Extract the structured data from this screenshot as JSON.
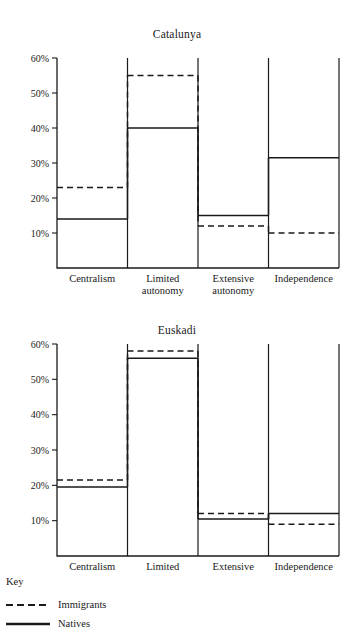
{
  "legend": {
    "title": "Key",
    "entries": [
      {
        "label": "Immigrants",
        "style": "dashed",
        "color": "#1a1a1a"
      },
      {
        "label": "Natives",
        "style": "solid",
        "color": "#1a1a1a"
      }
    ]
  },
  "axis": {
    "tick_labels": [
      "10%",
      "20%",
      "30%",
      "40%",
      "50%",
      "60%"
    ],
    "tick_values": [
      10,
      20,
      30,
      40,
      50,
      60
    ]
  },
  "categories": [
    "Centralism",
    "Limited autonomy",
    "Extensive autonomy",
    "Independence"
  ],
  "category_lines": [
    [
      "Centralism"
    ],
    [
      "Limited",
      "autonomy"
    ],
    [
      "Extensive",
      "autonomy"
    ],
    [
      "Independence"
    ]
  ],
  "chart_data": [
    {
      "type": "bar",
      "title": "Catalunya",
      "xlabel": "",
      "ylabel": "",
      "ylim": [
        0,
        60
      ],
      "grid": false,
      "legend_position": "bottom-left",
      "categories": [
        "Centralism",
        "Limited autonomy",
        "Extensive autonomy",
        "Independence"
      ],
      "series": [
        {
          "name": "Immigrants",
          "style": "dashed",
          "values": [
            23,
            55,
            12,
            10
          ]
        },
        {
          "name": "Natives",
          "style": "solid",
          "values": [
            14,
            40,
            15,
            31.5
          ]
        }
      ]
    },
    {
      "type": "bar",
      "title": "Euskadi",
      "xlabel": "",
      "ylabel": "",
      "ylim": [
        0,
        60
      ],
      "grid": false,
      "legend_position": "bottom-left",
      "categories": [
        "Centralism",
        "Limited autonomy",
        "Extensive autonomy",
        "Independence"
      ],
      "series": [
        {
          "name": "Immigrants",
          "style": "dashed",
          "values": [
            21.5,
            58,
            12,
            9
          ]
        },
        {
          "name": "Natives",
          "style": "solid",
          "values": [
            19.5,
            56,
            10.5,
            12
          ]
        }
      ]
    }
  ]
}
